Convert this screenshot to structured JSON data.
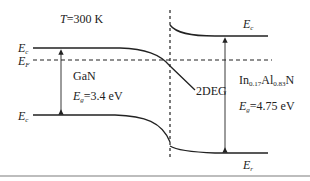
{
  "diagram": {
    "title_temperature": {
      "symbol": "T",
      "text": "=300 K"
    },
    "left_material": {
      "name": "GaN",
      "gap_label": {
        "symbol": "E",
        "sub": "g",
        "text": "=3.4 eV"
      }
    },
    "right_material": {
      "name_parts": [
        {
          "text": "In"
        },
        {
          "sub": "0.17"
        },
        {
          "text": "Al"
        },
        {
          "sub": "0.83"
        },
        {
          "text": "N"
        }
      ],
      "name_plain": "In0.17Al0.83N",
      "gap_label": {
        "symbol": "E",
        "sub": "g",
        "text": "=4.75 eV"
      }
    },
    "band_labels": {
      "left_conduction": {
        "symbol": "E",
        "sub": "c"
      },
      "left_fermi": {
        "symbol": "E",
        "sub": "F"
      },
      "left_valence": {
        "symbol": "E",
        "sub": "c"
      },
      "right_conduction": {
        "symbol": "E",
        "sub": "c"
      },
      "right_valence": {
        "symbol": "E",
        "sub": "r"
      }
    },
    "annotation_2deg": "2DEG",
    "colors": {
      "line": "#222222",
      "rule": "#bdbdbd"
    }
  }
}
